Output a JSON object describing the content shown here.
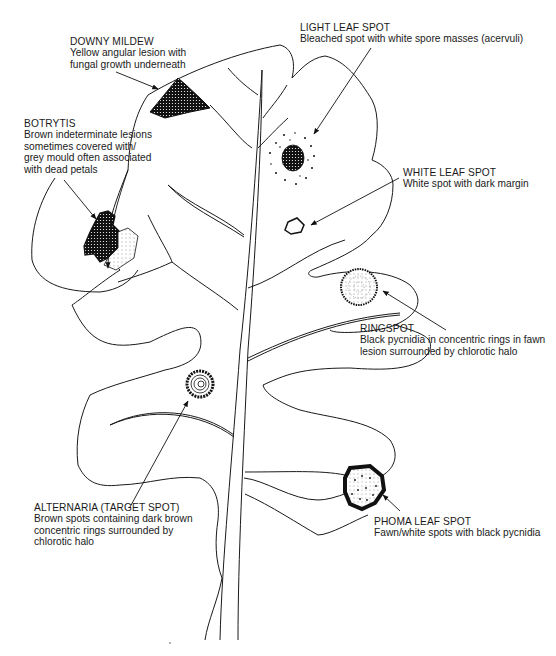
{
  "diagram": {
    "colors": {
      "ink": "#1a1a1a",
      "background": "#ffffff"
    },
    "labels": [
      {
        "id": "downy-mildew",
        "title": "DOWNY MILDEW",
        "lines": [
          "Yellow angular lesion with",
          "fungal growth underneath"
        ]
      },
      {
        "id": "botrytis",
        "title": "BOTRYTIS",
        "lines": [
          "Brown indeterminate lesions",
          "sometimes covered with/",
          "grey mould often associated",
          "with dead petals"
        ]
      },
      {
        "id": "light-leaf-spot",
        "title": "LIGHT LEAF SPOT",
        "lines": [
          "Bleached spot with white spore masses (acervuli)"
        ]
      },
      {
        "id": "white-leaf-spot",
        "title": "WHITE LEAF SPOT",
        "lines": [
          "White spot with dark margin"
        ]
      },
      {
        "id": "ringspot",
        "title": "RINGSPOT",
        "lines": [
          "Black pycnidia in concentric rings in fawn",
          "lesion surrounded by chlorotic halo"
        ]
      },
      {
        "id": "alternaria",
        "title": "ALTERNARIA (TARGET SPOT)",
        "lines": [
          "Brown spots containing dark brown",
          "concentric rings  surrounded by",
          "chlorotic halo"
        ]
      },
      {
        "id": "phoma-leaf-spot",
        "title": "PHOMA LEAF SPOT",
        "lines": [
          "Fawn/white spots with black pycnidia"
        ]
      }
    ]
  }
}
